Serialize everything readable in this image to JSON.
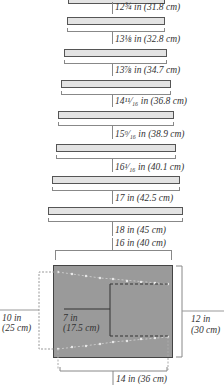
{
  "figure": {
    "type": "knitting schematic",
    "rows": [
      {
        "label": "12¾ in (31.8 cm)",
        "inches": "12 3/4",
        "cm": 31.8
      },
      {
        "label": "13⅛ in (32.8 cm)",
        "inches": "13 1/8",
        "cm": 32.8
      },
      {
        "label": "13⅞ in (34.7 cm)",
        "inches": "13 7/8",
        "cm": 34.7
      },
      {
        "label": "14¹¹⁄₁₆ in (36.8 cm)",
        "inches": "14 11/16",
        "cm": 36.8
      },
      {
        "label": "15⁹⁄₁₆ in (38.9 cm)",
        "inches": "15 9/16",
        "cm": 38.9
      },
      {
        "label": "16¹⁄₁₆ in (40.1 cm)",
        "inches": "16 1/16",
        "cm": 40.1
      },
      {
        "label": "17 in (42.5 cm)",
        "inches": "17",
        "cm": 42.5
      },
      {
        "label": "18 in (45 cm)",
        "inches": "18",
        "cm": 45
      }
    ],
    "panel": {
      "top_width": "16 in (40 cm)",
      "left_height_line1": "10 in",
      "left_height_line2": "(25 cm)",
      "right_height_line1": "12 in",
      "right_height_line2": "(30 cm)",
      "inner_width_line1": "7 in",
      "inner_width_line2": "(17.5 cm)",
      "bottom_width": "14 in (36 cm)"
    },
    "colors": {
      "bar_fill": "#e3e3e3",
      "panel_fill": "#9a9a9a",
      "line": "#888888"
    }
  }
}
